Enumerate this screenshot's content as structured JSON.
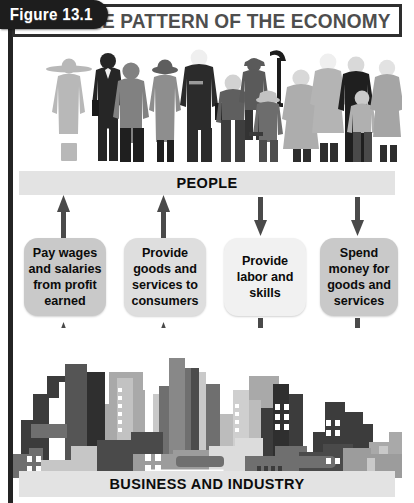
{
  "figure": {
    "label": "Figure 13.1",
    "title": "THE PATTERN OF THE ECONOMY"
  },
  "diagram": {
    "top_label": "PEOPLE",
    "bottom_label": "BUSINESS AND INDUSTRY",
    "boxes": [
      {
        "id": "pay-wages",
        "text": "Pay wages and salaries from profit earned",
        "direction": "up",
        "shade": "shade-dark"
      },
      {
        "id": "provide-goods",
        "text": "Provide goods and services to consumers",
        "direction": "up",
        "shade": "shade-mid"
      },
      {
        "id": "provide-labor",
        "text": "Provide labor and skills",
        "direction": "down",
        "shade": "shade-light"
      },
      {
        "id": "spend-money",
        "text": "Spend money for goods and services",
        "direction": "down",
        "shade": "shade-dark"
      }
    ],
    "arrow_labels": {
      "up": "arrow pointing up to people",
      "down": "arrow pointing down to business and industry"
    }
  },
  "colors": {
    "bar_fill": "#e3e3e3",
    "arrow": "#4a4a4a",
    "title_text": "#4e4e4e",
    "tab_fill": "#1d1d1d",
    "frame": "#2e2e2e",
    "building_dark": "#3c3c3c",
    "building_mid": "#6f6f6f",
    "building_light": "#a9a9a9",
    "building_pale": "#c9c9c9",
    "figure_dark": "#2a2a2a",
    "figure_mid": "#7d7d7d",
    "figure_light": "#b4b4b4",
    "figure_pale": "#d6d6d6"
  }
}
